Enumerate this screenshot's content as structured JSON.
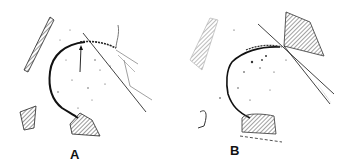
{
  "figure": {
    "panels": [
      {
        "id": "A",
        "label": "A",
        "description": "Hip joint line drawing with femoral head arc, arrow to joint surface, and tangent line"
      },
      {
        "id": "B",
        "label": "B",
        "description": "Hip joint line drawing with femoral head arc and crossing tangent lines"
      }
    ],
    "colors": {
      "ink": "#111111",
      "background": "#ffffff",
      "hatch": "#333333"
    }
  }
}
